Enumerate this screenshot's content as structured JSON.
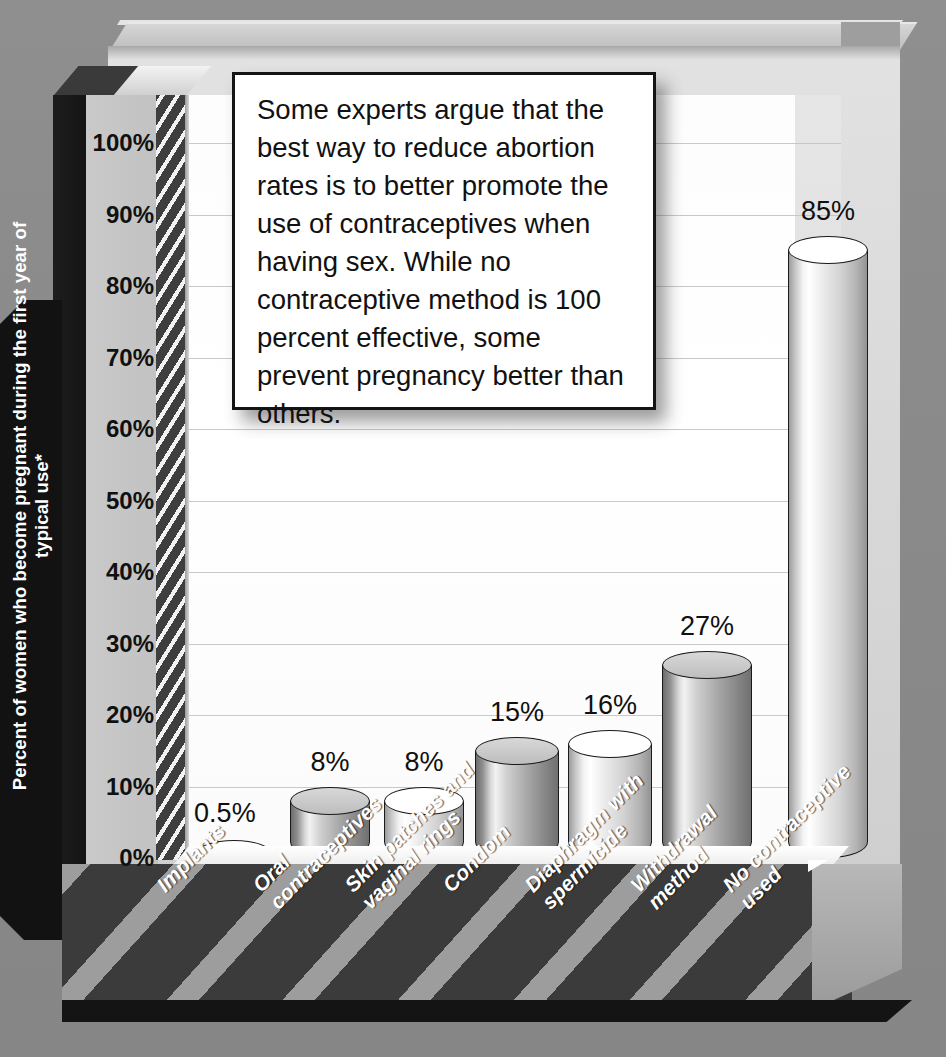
{
  "chart_data": {
    "type": "bar",
    "title": "",
    "xlabel": "",
    "ylabel": "Percent of women who become pregnant during the first year of typical use*",
    "ylim": [
      0,
      100
    ],
    "ytick_labels": [
      "100%",
      "90%",
      "80%",
      "70%",
      "60%",
      "50%",
      "40%",
      "30%",
      "20%",
      "10%",
      "0%"
    ],
    "ytick_values": [
      100,
      90,
      80,
      70,
      60,
      50,
      40,
      30,
      20,
      10,
      0
    ],
    "grid": true,
    "legend": "none",
    "categories": [
      "Implants",
      "Oral\ncontraceptives",
      "Skin patches and\nvaginal rings",
      "Condom",
      "Diaphragm with\nspermicide",
      "Withdrawal\nmethod",
      "No contraceptive\nused"
    ],
    "values": [
      0.5,
      8,
      8,
      15,
      16,
      27,
      85
    ],
    "value_labels": [
      "0.5%",
      "8%",
      "8%",
      "15%",
      "16%",
      "27%",
      "85%"
    ]
  },
  "callout": {
    "text": "Some experts argue that the best way to reduce abortion rates is to better promote the use of contraceptives when having sex. While no contraceptive method is 100 percent effective, some prevent pregnancy better than others."
  },
  "colors": {
    "background": "#8c8c8c",
    "plot_background": "#ffffff",
    "axis_block": "#121212",
    "plinth": "#3a3a3a",
    "gridline": "#c9c9c9",
    "bar_light": "#f2f2f2",
    "bar_dark": "#707070",
    "text_dark": "#101010",
    "text_light": "#ffffff"
  }
}
